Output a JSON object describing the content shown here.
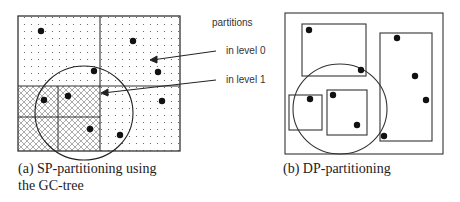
{
  "panel_a": {
    "caption_line1": "(a) SP-partitioning using",
    "caption_line2": "the GC-tree"
  },
  "panel_b": {
    "caption": "(b) DP-partitioning"
  },
  "legend": {
    "title": "partitions",
    "level0": "in level 0",
    "level1": "in level 1"
  },
  "colors": {
    "stroke": "#333333",
    "point": "#111111",
    "background": "#ffffff"
  }
}
